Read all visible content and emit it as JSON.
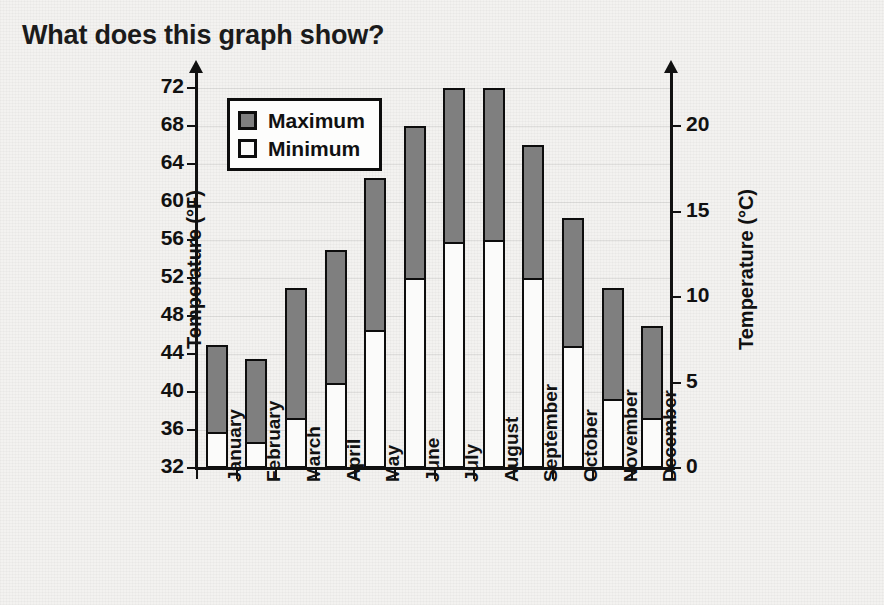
{
  "title": "What does this graph show?",
  "legend": {
    "position": "top-left-inside",
    "items": [
      {
        "label": "Maximum",
        "swatch": "gray-square-icon",
        "color": "#7f7f7f"
      },
      {
        "label": "Minimum",
        "swatch": "white-square-icon",
        "color": "#fbfbfa"
      }
    ]
  },
  "axes": {
    "left": {
      "title": "Temperature (°F)",
      "ticks": [
        "72",
        "68",
        "64",
        "60",
        "56",
        "52",
        "48",
        "44",
        "40",
        "36",
        "32"
      ]
    },
    "right": {
      "title": "Temperature (°C)",
      "ticks": [
        "20",
        "15",
        "10",
        "5",
        "0"
      ]
    }
  },
  "chart_data": {
    "type": "bar",
    "title": "What does this graph show?",
    "subtitle": "",
    "xlabel": "",
    "ylabel": "Temperature (°F)",
    "ylabel_secondary": "Temperature (°C)",
    "ylim": [
      32,
      72
    ],
    "ylim_secondary": [
      0,
      22.2
    ],
    "ytick_step": 4,
    "ytick_step_secondary": 5,
    "yticks": [
      32,
      36,
      40,
      44,
      48,
      52,
      56,
      60,
      64,
      68,
      72
    ],
    "yticks_secondary": [
      0,
      5,
      10,
      15,
      20
    ],
    "grid": "faint-horizontal",
    "legend_position": "inside-top-left",
    "bar_style": "floating-range-bars (min segment white, max segment gray, stacked from axis base)",
    "categories": [
      "January",
      "February",
      "March",
      "April",
      "May",
      "June",
      "July",
      "August",
      "September",
      "October",
      "November",
      "December"
    ],
    "series": [
      {
        "name": "Maximum",
        "units": "°F",
        "values": [
          45,
          43.5,
          51,
          55,
          62.5,
          68,
          72,
          72,
          66,
          58.3,
          51,
          47
        ]
      },
      {
        "name": "Minimum",
        "units": "°F",
        "values": [
          35.8,
          34.7,
          37.3,
          41,
          46.5,
          52,
          55.8,
          56,
          52,
          44.8,
          39.3,
          37.3
        ]
      }
    ]
  }
}
